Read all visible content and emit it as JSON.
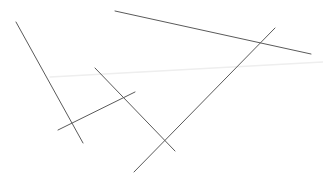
{
  "canvas": {
    "width": 323,
    "height": 183,
    "background": "#ffffff"
  },
  "lines": [
    {
      "id": "line-a",
      "x1": 16,
      "y1": 22,
      "x2": 83,
      "y2": 143,
      "color": "#5a5a5a",
      "width": 1
    },
    {
      "id": "line-b",
      "x1": 115,
      "y1": 11,
      "x2": 311,
      "y2": 54,
      "color": "#5a5a5a",
      "width": 1
    },
    {
      "id": "line-c",
      "x1": 275,
      "y1": 28,
      "x2": 134,
      "y2": 172,
      "color": "#5a5a5a",
      "width": 1
    },
    {
      "id": "line-d",
      "x1": 95,
      "y1": 68,
      "x2": 175,
      "y2": 151,
      "color": "#5a5a5a",
      "width": 1
    },
    {
      "id": "line-e",
      "x1": 58,
      "y1": 130,
      "x2": 135,
      "y2": 92,
      "color": "#5a5a5a",
      "width": 1
    },
    {
      "id": "line-faint",
      "x1": 50,
      "y1": 77,
      "x2": 323,
      "y2": 62,
      "color": "#eeeeee",
      "width": 1.5
    }
  ]
}
